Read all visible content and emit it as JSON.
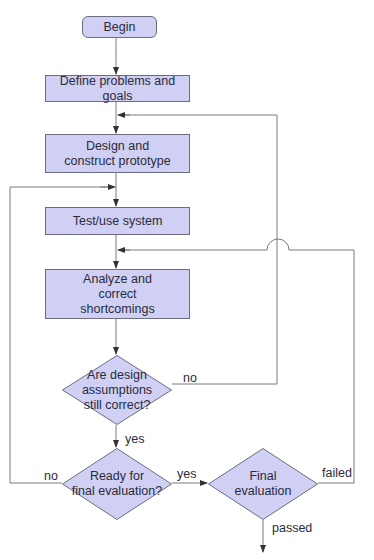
{
  "flowchart": {
    "colors": {
      "fill": "#cfd0f3",
      "stroke": "#6d6d82",
      "line": "#7a7a7a",
      "text": "#2b2b3d"
    },
    "nodes": {
      "begin": "Begin",
      "define": "Define problems and goals",
      "design": "Design and\nconstruct prototype",
      "test": "Test/use system",
      "analyze": "Analyze and\ncorrect\nshortcomings",
      "assumptions": "Are design\nassumptions\nstill correct?",
      "ready": "Ready for\nfinal evaluation?",
      "final": "Final\nevaluation"
    },
    "edge_labels": {
      "assumptions_no": "no",
      "assumptions_yes": "yes",
      "ready_no": "no",
      "ready_yes": "yes",
      "final_failed": "failed",
      "final_passed": "passed"
    }
  }
}
